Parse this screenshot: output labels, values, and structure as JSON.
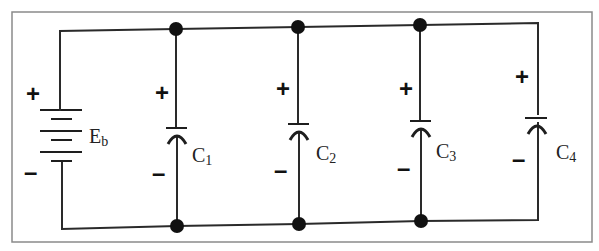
{
  "diagram": {
    "type": "circuit-schematic",
    "battery": {
      "label": "E",
      "subscript": "b",
      "plus": "+",
      "minus": "–"
    },
    "capacitors": [
      {
        "label": "C",
        "subscript": "1",
        "plus": "+",
        "minus": "–"
      },
      {
        "label": "C",
        "subscript": "2",
        "plus": "+",
        "minus": "–"
      },
      {
        "label": "C",
        "subscript": "3",
        "plus": "+",
        "minus": "–"
      },
      {
        "label": "C",
        "subscript": "4",
        "plus": "+",
        "minus": "–"
      }
    ],
    "colors": {
      "wire": "#2a2a2a",
      "node": "#111111",
      "frame": "#8a8a8a",
      "background": "#ffffff"
    }
  }
}
